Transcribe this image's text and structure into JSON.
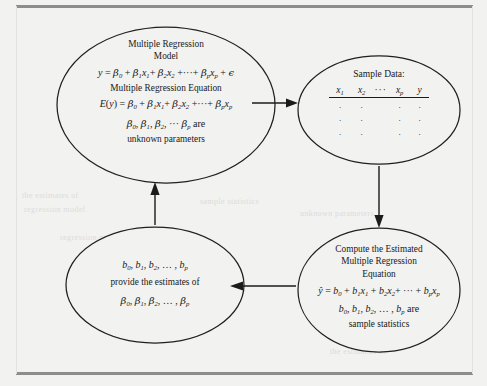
{
  "figure": {
    "kind": "flow-diagram",
    "title_visible": false,
    "background_color": "#f2f2f0",
    "line_color": "#1b1b1a",
    "rule_color": "#8d8d8d",
    "nodes": [
      {
        "id": "model",
        "shape": "ellipse",
        "position": "top-left",
        "lines": [
          "Multiple Regression",
          "Model",
          "y = β₀ + β₁x₁ + β₂x₂ + ··· + βₚxₚ + ϵ",
          "Multiple Regression Equation",
          "E(y) = β₀ + β₁x₁ + β₂x₂ + ··· + βₚxₚ",
          "β₀, β₁, β₂, ··· βₚ are",
          "unknown parameters"
        ],
        "title_1": "Multiple Regression",
        "title_2": "Model",
        "subtitle": "Multiple Regression Equation",
        "note_tail": "are",
        "note_last": "unknown parameters"
      },
      {
        "id": "sample-data",
        "shape": "ellipse",
        "position": "top-right",
        "heading": "Sample Data:",
        "columns": [
          "x1",
          "x2",
          "···",
          "xp",
          "y"
        ],
        "rows": [
          [
            ".",
            ".",
            ".",
            "."
          ],
          [
            ".",
            ".",
            ".",
            "."
          ],
          [
            ".",
            ".",
            ".",
            "."
          ]
        ]
      },
      {
        "id": "compute-estimated",
        "shape": "ellipse",
        "position": "bottom-right",
        "title_1": "Compute the Estimated",
        "title_2": "Multiple Regression",
        "title_3": "Equation",
        "equation": "ŷ = b₀ + b₁x₁ + b₂x₂ + ··· + bₚxₚ",
        "note_tail": "are",
        "note_last": "sample statistics"
      },
      {
        "id": "estimates",
        "shape": "ellipse",
        "position": "bottom-left",
        "line_1": "b₀, b₁, b₂, …, bₚ",
        "line_2": "provide the estimates of",
        "line_3": "β₀, β₁, β₂, …, βₚ"
      }
    ],
    "arrows": [
      {
        "id": "model-to-sample",
        "from": "model",
        "to": "sample-data",
        "direction": "right"
      },
      {
        "id": "sample-to-compute",
        "from": "sample-data",
        "to": "compute-estimated",
        "direction": "down"
      },
      {
        "id": "compute-to-estimates",
        "from": "compute-estimated",
        "to": "estimates",
        "direction": "left"
      },
      {
        "id": "estimates-to-model",
        "from": "estimates",
        "to": "model",
        "direction": "up"
      }
    ]
  },
  "bleed_text": {
    "l1": "the estimates of",
    "l2": "regression model",
    "l3": "sample statistics",
    "l4": "unknown parameters"
  }
}
